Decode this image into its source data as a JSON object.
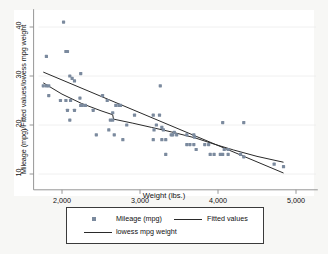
{
  "chart_data": {
    "type": "scatter",
    "title": "",
    "xlabel": "Weight (lbs.)",
    "ylabel": "Mileage (mpg)/Fitted values/lowess mpg  weight",
    "xlim": [
      1700,
      5100
    ],
    "ylim": [
      8,
      42
    ],
    "xticks": [
      2000,
      3000,
      4000,
      5000
    ],
    "xticklabels": [
      "2,000",
      "3,000",
      "4,000",
      "5,000"
    ],
    "yticks": [
      10,
      20,
      30,
      40
    ],
    "yticklabels": [
      "10",
      "20",
      "30",
      "40"
    ],
    "grid": false,
    "legend_position": "bottom",
    "marker_color": "#7b8a9e",
    "line_color": "#2a2a2a",
    "axis_color": "#8a8a8a",
    "series": [
      {
        "name": "Mileage (mpg)",
        "type": "scatter",
        "points": [
          [
            2020,
            41.0
          ],
          [
            1800,
            34.0
          ],
          [
            2050,
            35.0
          ],
          [
            2070,
            35.0
          ],
          [
            2240,
            30.5
          ],
          [
            2100,
            30.0
          ],
          [
            2160,
            29.0
          ],
          [
            2130,
            29.5
          ],
          [
            1760,
            28.0
          ],
          [
            1800,
            28.0
          ],
          [
            1830,
            28.0
          ],
          [
            1830,
            26.0
          ],
          [
            1980,
            25.0
          ],
          [
            2050,
            25.0
          ],
          [
            2110,
            25.0
          ],
          [
            2230,
            25.5
          ],
          [
            2240,
            24.0
          ],
          [
            2260,
            24.0
          ],
          [
            2300,
            24.0
          ],
          [
            2160,
            23.0
          ],
          [
            2070,
            23.0
          ],
          [
            2100,
            21.0
          ],
          [
            2400,
            23.0
          ],
          [
            2520,
            26.0
          ],
          [
            2580,
            25.0
          ],
          [
            2650,
            22.5
          ],
          [
            2690,
            24.0
          ],
          [
            2730,
            24.0
          ],
          [
            2750,
            24.0
          ],
          [
            2620,
            21.0
          ],
          [
            2650,
            21.0
          ],
          [
            2600,
            19.0
          ],
          [
            2440,
            18.0
          ],
          [
            2670,
            18.0
          ],
          [
            2830,
            20.0
          ],
          [
            2780,
            17.0
          ],
          [
            2930,
            22.0
          ],
          [
            3170,
            22.0
          ],
          [
            3250,
            22.0
          ],
          [
            3260,
            28.0
          ],
          [
            3210,
            20.0
          ],
          [
            3280,
            19.5
          ],
          [
            3300,
            19.0
          ],
          [
            3180,
            19.0
          ],
          [
            3400,
            18.0
          ],
          [
            3420,
            18.0
          ],
          [
            3440,
            18.5
          ],
          [
            3470,
            18.0
          ],
          [
            3600,
            18.0
          ],
          [
            3690,
            18.0
          ],
          [
            3700,
            17.5
          ],
          [
            3170,
            17.0
          ],
          [
            3280,
            17.0
          ],
          [
            3330,
            17.0
          ],
          [
            3600,
            16.0
          ],
          [
            3640,
            16.0
          ],
          [
            3690,
            16.0
          ],
          [
            3720,
            15.0
          ],
          [
            3830,
            16.0
          ],
          [
            3880,
            16.0
          ],
          [
            3900,
            14.0
          ],
          [
            3950,
            14.0
          ],
          [
            4030,
            14.0
          ],
          [
            4060,
            14.0
          ],
          [
            4080,
            15.0
          ],
          [
            4130,
            15.0
          ],
          [
            4130,
            14.0
          ],
          [
            4060,
            20.5
          ],
          [
            4330,
            20.5
          ],
          [
            4290,
            14.0
          ],
          [
            4330,
            13.5
          ],
          [
            4720,
            12.0
          ],
          [
            4840,
            11.5
          ],
          [
            3330,
            14.0
          ]
        ]
      },
      {
        "name": "Fitted values",
        "type": "line",
        "points": [
          [
            1760,
            30.8
          ],
          [
            4840,
            10.2
          ]
        ]
      },
      {
        "name": "lowess mpg  weight",
        "type": "line",
        "points": [
          [
            1760,
            28.6
          ],
          [
            2000,
            26.3
          ],
          [
            2250,
            24.4
          ],
          [
            2500,
            22.9
          ],
          [
            2650,
            22.1
          ],
          [
            2660,
            21.2
          ],
          [
            2900,
            20.4
          ],
          [
            3150,
            19.5
          ],
          [
            3400,
            18.6
          ],
          [
            3450,
            18.4
          ],
          [
            3700,
            17.4
          ],
          [
            3950,
            16.1
          ],
          [
            4200,
            14.9
          ],
          [
            4500,
            13.6
          ],
          [
            4840,
            12.4
          ]
        ]
      }
    ]
  },
  "legend": {
    "entries": [
      {
        "label": "Mileage (mpg)",
        "marker": "square-marker"
      },
      {
        "label": "Fitted values",
        "marker": "line-marker"
      },
      {
        "label": "lowess mpg  weight",
        "marker": "line-marker"
      }
    ]
  }
}
